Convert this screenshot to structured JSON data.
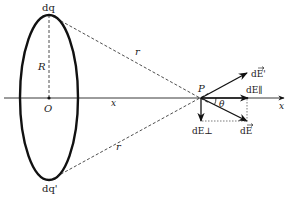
{
  "diagram": {
    "labels": {
      "charge_top": "dq",
      "charge_bottom": "dq'",
      "radius": "R",
      "center": "O",
      "distance_upper": "r",
      "distance_lower": "r",
      "axis_distance": "x",
      "point": "P",
      "angle": "θ",
      "axis": "x",
      "field_prime": "dE'",
      "field_parallel": "dE∥",
      "field_perp": "dE⊥",
      "field": "dE"
    },
    "colors": {
      "stroke": "#111111",
      "background": "#ffffff"
    }
  }
}
